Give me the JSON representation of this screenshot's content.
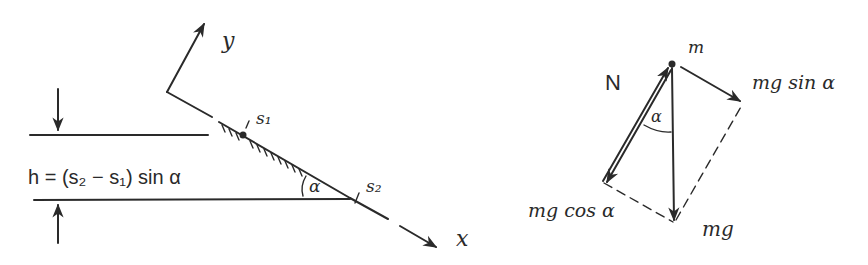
{
  "left_diagram": {
    "axis_y_label": "y",
    "axis_x_label": "x",
    "point_s1_label": "s₁",
    "point_s2_label": "s₂",
    "angle_label": "α",
    "height_formula": "h = (s₂ − s₁) sin α"
  },
  "right_diagram": {
    "mass_label": "m",
    "normal_force_label": "N",
    "parallel_component_label": "mg sin α",
    "perpendicular_component_label": "mg cos α",
    "gravity_label": "mg",
    "angle_label": "α"
  },
  "colors": {
    "ink": "#2a2a2a",
    "background": "#ffffff"
  }
}
